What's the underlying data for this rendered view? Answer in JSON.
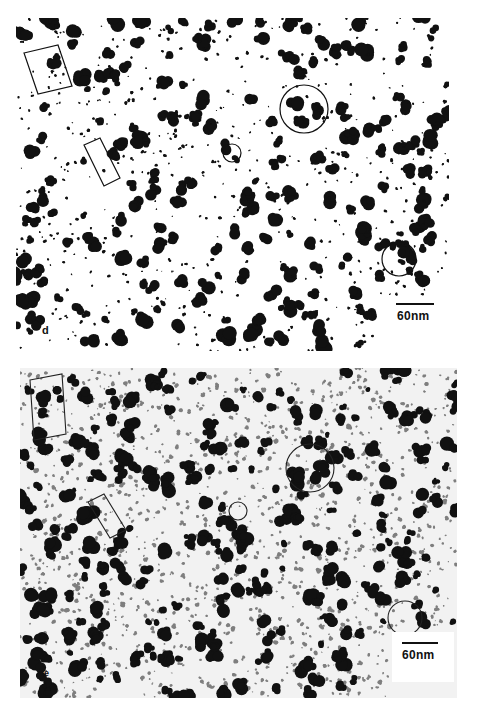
{
  "figure": {
    "panels": [
      {
        "id": "d",
        "label": "d",
        "scale_bar_label": "60nm",
        "background": "#ffffff",
        "particle_color": "#111111",
        "annotations": [
          {
            "type": "rectangle",
            "desc": "tilted box top-left enclosing two particles"
          },
          {
            "type": "rectangle",
            "desc": "tilted box mid-left enclosing row of particles"
          },
          {
            "type": "circle",
            "desc": "small circle around single particle, center"
          },
          {
            "type": "circle",
            "desc": "large circle around cluster, upper right"
          },
          {
            "type": "circle",
            "desc": "circle around cluster, lower right"
          }
        ]
      },
      {
        "id": "e",
        "label": "e",
        "scale_bar_label": "60nm",
        "background": "#f4f4f4",
        "particle_color": "#111111",
        "annotations": [
          {
            "type": "rectangle",
            "desc": "tilted box top-left"
          },
          {
            "type": "rectangle",
            "desc": "tilted box mid-left"
          },
          {
            "type": "circle",
            "desc": "small circle around single particle, center"
          },
          {
            "type": "circle",
            "desc": "large circle, upper right"
          },
          {
            "type": "circle",
            "desc": "circle, lower right"
          }
        ]
      }
    ]
  }
}
